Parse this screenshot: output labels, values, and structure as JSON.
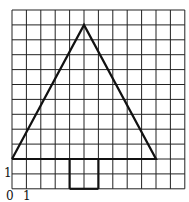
{
  "diagram": {
    "grid": {
      "cols": 12,
      "rows": 12,
      "x0": 12,
      "y0": 10,
      "cell_w": 14.4,
      "cell_h": 14.9,
      "line_color": "#222222"
    },
    "triangle": {
      "points_grid": [
        [
          0,
          10
        ],
        [
          5,
          1
        ],
        [
          10,
          10
        ]
      ],
      "stroke": "#111111"
    },
    "rectangle": {
      "x_from": 4,
      "x_to": 6,
      "y_from": 10,
      "y_to": 12,
      "stroke": "#111111"
    },
    "labels": {
      "origin": "0",
      "x_unit": "1",
      "y_unit": "1"
    }
  }
}
